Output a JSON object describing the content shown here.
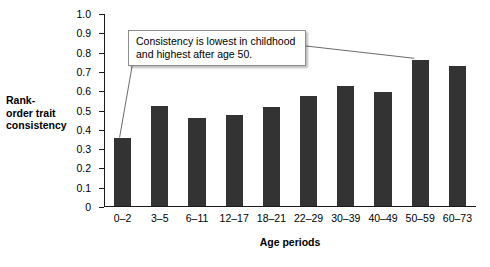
{
  "chart_data": {
    "type": "bar",
    "title": "",
    "subtitle": "",
    "xlabel": "Age periods",
    "ylabel": "Rank-\norder trait\nconsistency",
    "categories": [
      "0–2",
      "3–5",
      "6–11",
      "12–17",
      "18–21",
      "22–29",
      "30–39",
      "40–49",
      "50–59",
      "60–73"
    ],
    "values": [
      0.35,
      0.52,
      0.455,
      0.47,
      0.515,
      0.57,
      0.62,
      0.59,
      0.755,
      0.725
    ],
    "ylim": [
      0,
      1.0
    ],
    "ytick_labels": [
      "1.0",
      "0.9",
      "0.8",
      "0.7",
      "0.6",
      "0.5",
      "0.4",
      "0.3",
      "0.2",
      "0.1",
      "0"
    ],
    "ytick_values": [
      1.0,
      0.9,
      0.8,
      0.7,
      0.6,
      0.5,
      0.4,
      0.3,
      0.2,
      0.1,
      0
    ],
    "grid": false,
    "legend": null,
    "bar_color": "#333333",
    "axis_color": "#1a1a1a",
    "annotations": [
      {
        "text": "Consistency is lowest in childhood and highest after age 50.",
        "line1": "Consistency is lowest in childhood",
        "line2": "and highest after age 50.",
        "points_to": [
          "0–2",
          "50–59"
        ]
      }
    ]
  }
}
